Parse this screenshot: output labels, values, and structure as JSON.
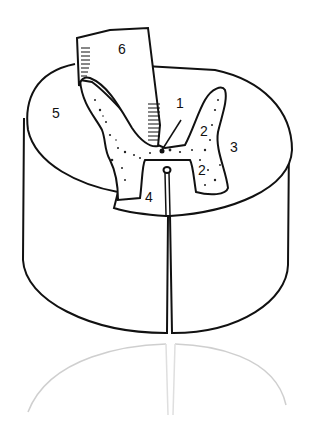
{
  "figure": {
    "labels": [
      {
        "id": "1",
        "text": "1",
        "x": 178,
        "y": 98
      },
      {
        "id": "2a",
        "text": "2",
        "x": 201,
        "y": 124
      },
      {
        "id": "2b",
        "text": "2",
        "x": 199,
        "y": 164
      },
      {
        "id": "3",
        "text": "3",
        "x": 230,
        "y": 140
      },
      {
        "id": "4",
        "text": "4",
        "x": 145,
        "y": 190
      },
      {
        "id": "5",
        "text": "5",
        "x": 52,
        "y": 106
      },
      {
        "id": "6",
        "text": "6",
        "x": 118,
        "y": 42
      }
    ],
    "colors": {
      "ink": "#111111",
      "paper": "#ffffff",
      "reflection": "#bdbdbd"
    }
  }
}
